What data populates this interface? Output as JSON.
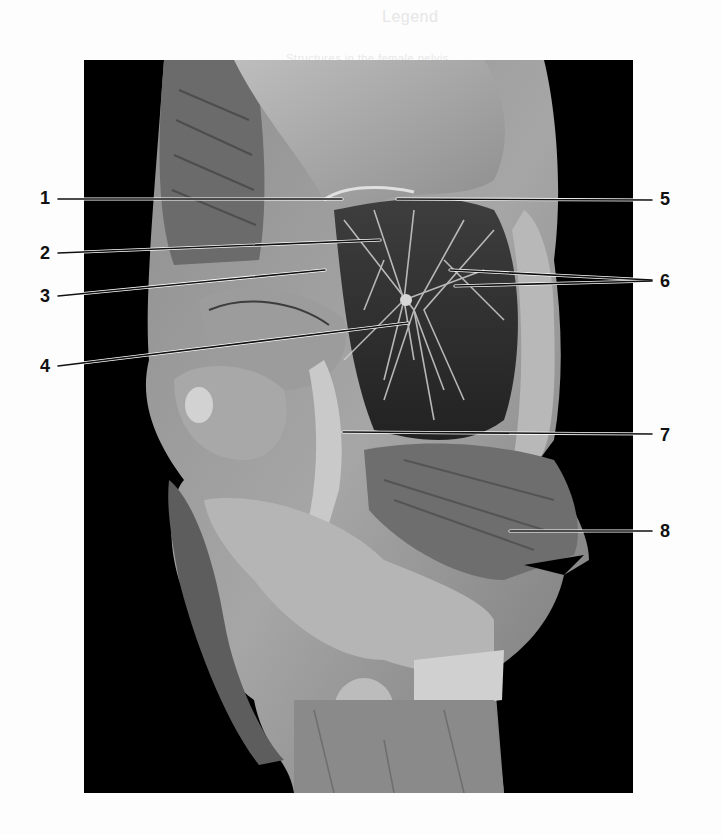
{
  "figure": {
    "type": "anatomical photograph (sagittal section, pelvis)",
    "colors": {
      "background": "#000000",
      "page": "#fdfdfd",
      "tissue_light": "#c9c9c9",
      "tissue_mid": "#8a8a8a",
      "tissue_dark": "#4a4a4a",
      "leader_line": "#111111",
      "label_text": "#111111"
    },
    "labels": [
      {
        "id": "1",
        "text": "1",
        "side": "left",
        "y": 198
      },
      {
        "id": "2",
        "text": "2",
        "side": "left",
        "y": 253
      },
      {
        "id": "3",
        "text": "3",
        "side": "left",
        "y": 296
      },
      {
        "id": "4",
        "text": "4",
        "side": "left",
        "y": 366
      },
      {
        "id": "5",
        "text": "5",
        "side": "right",
        "y": 199
      },
      {
        "id": "6",
        "text": "6",
        "side": "right",
        "y": 281
      },
      {
        "id": "7",
        "text": "7",
        "side": "right",
        "y": 436
      },
      {
        "id": "8",
        "text": "8",
        "side": "right",
        "y": 531
      }
    ]
  },
  "bleed_through": {
    "top_heading": "Legend",
    "top_line": "Structures in the female pelvis",
    "bottom_line": ""
  }
}
